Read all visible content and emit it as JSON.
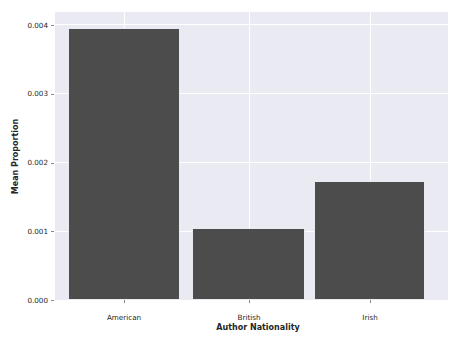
{
  "chart_data": {
    "type": "bar",
    "title": "",
    "xlabel": "Author Nationality",
    "ylabel": "Mean Proportion",
    "categories": [
      "American",
      "British",
      "Irish"
    ],
    "values": [
      0.00394,
      0.00105,
      0.00172
    ],
    "ylim": [
      0.0,
      0.004
    ],
    "yticks": [
      0.0,
      0.001,
      0.002,
      0.003,
      0.004
    ],
    "ytick_labels": [
      "0.000",
      "0.001",
      "0.002",
      "0.003",
      "0.004"
    ],
    "xtick_labels": [
      "American",
      "British",
      "Irish"
    ],
    "grid": true,
    "legend": "none",
    "bar_color": "#4c4c4c",
    "plot_background": "#eaeaf2",
    "gridline_color": "#ffffff",
    "figure_background": "#ffffff"
  }
}
